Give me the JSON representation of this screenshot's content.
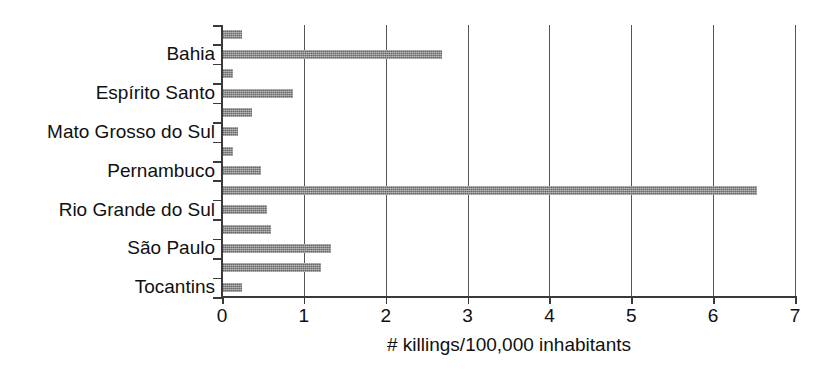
{
  "chart_data": {
    "type": "bar",
    "orientation": "horizontal",
    "title": "",
    "subtitle": "",
    "xlabel": "# killings/100,000 inhabitants",
    "ylabel": "",
    "xlim": [
      0,
      7
    ],
    "xticks": [
      "0",
      "1",
      "2",
      "3",
      "4",
      "5",
      "6",
      "7"
    ],
    "xtick_values": [
      0,
      1,
      2,
      3,
      4,
      5,
      6,
      7
    ],
    "grid": "vertical-gridlines-at-integer-x",
    "legend": "none",
    "bar_color": "#7d7d7d",
    "axis_color": "#3a3a3a",
    "gridline_color": "#555555",
    "visible_category_labels": [
      "Bahia",
      "Espírito Santo",
      "Mato Grosso do Sul",
      "Pernambuco",
      "Rio Grande do Sul",
      "São Paulo",
      "Tocantins"
    ],
    "bars": [
      {
        "index": 0,
        "label": "",
        "value": 0.25
      },
      {
        "index": 1,
        "label": "Bahia",
        "value": 2.69
      },
      {
        "index": 2,
        "label": "",
        "value": 0.14
      },
      {
        "index": 3,
        "label": "Espírito Santo",
        "value": 0.87
      },
      {
        "index": 4,
        "label": "",
        "value": 0.37
      },
      {
        "index": 5,
        "label": "Mato Grosso do Sul",
        "value": 0.2
      },
      {
        "index": 6,
        "label": "",
        "value": 0.13
      },
      {
        "index": 7,
        "label": "Pernambuco",
        "value": 0.48
      },
      {
        "index": 8,
        "label": "",
        "value": 6.53
      },
      {
        "index": 9,
        "label": "Rio Grande do Sul",
        "value": 0.55
      },
      {
        "index": 10,
        "label": "",
        "value": 0.6
      },
      {
        "index": 11,
        "label": "São Paulo",
        "value": 1.33
      },
      {
        "index": 12,
        "label": "",
        "value": 1.21
      },
      {
        "index": 13,
        "label": "Tocantins",
        "value": 0.24
      }
    ]
  }
}
